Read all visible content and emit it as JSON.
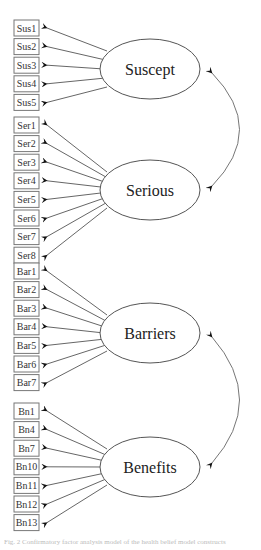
{
  "diagram": {
    "type": "structural-equation-measurement-model",
    "factors": [
      {
        "name": "Suscept",
        "cx": 150,
        "cy": 69,
        "rx": 50,
        "ry": 30,
        "indicators": [
          "Sus1",
          "Sus2",
          "Sus3",
          "Sus4",
          "Sus5"
        ],
        "first_box_y": 20
      },
      {
        "name": "Serious",
        "cx": 150,
        "cy": 190,
        "rx": 50,
        "ry": 30,
        "indicators": [
          "Ser1",
          "Ser2",
          "Ser3",
          "Ser4",
          "Ser5",
          "Ser6",
          "Ser7",
          "Ser8"
        ],
        "first_box_y": 117
      },
      {
        "name": "Barriers",
        "cx": 150,
        "cy": 333,
        "rx": 50,
        "ry": 30,
        "indicators": [
          "Bar1",
          "Bar2",
          "Bar3",
          "Bar4",
          "Bar5",
          "Bar6",
          "Bar7"
        ],
        "first_box_y": 263
      },
      {
        "name": "Benefits",
        "cx": 150,
        "cy": 467,
        "rx": 50,
        "ry": 30,
        "indicators": [
          "Bn1",
          "Bn4",
          "Bn7",
          "Bn10",
          "Bn11",
          "Bn12",
          "Bn13"
        ],
        "first_box_y": 403
      }
    ],
    "covariances": [
      {
        "from": "Suscept",
        "to": "Serious"
      },
      {
        "from": "Barriers",
        "to": "Benefits"
      }
    ],
    "box": {
      "x": 14,
      "width": 25,
      "height": 16,
      "spacing": 18.6
    },
    "colors": {
      "line": "#555555",
      "box_border": "#777777",
      "text": "#222222"
    }
  },
  "caption": "Fig. 2 Confirmatory factor analysis model of the health belief model constructs"
}
